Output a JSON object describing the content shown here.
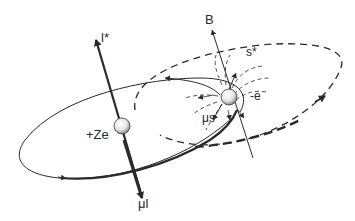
{
  "diagram": {
    "type": "spin-orbit coupling illustration",
    "labels": {
      "orbital_angular_momentum": "l*",
      "magnetic_field": "B",
      "spin": "s*",
      "electron_charge": "-e",
      "nucleus_charge": "+Ze",
      "spin_magnetic_moment": "μs",
      "orbital_magnetic_moment": "μl"
    },
    "elements": {
      "nucleus": "sphere with charge +Ze",
      "electron": "sphere with charge -e",
      "nucleus_orbit": "solid ellipse (orbit in electron rest frame)",
      "electron_orbit": "dashed ellipse",
      "field_lines": "dashed dipole field lines around electron"
    },
    "colors": {
      "ink": "#2a2a2a",
      "background": "#ffffff"
    }
  },
  "caption": {
    "text": ""
  }
}
